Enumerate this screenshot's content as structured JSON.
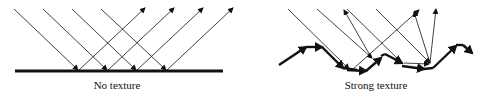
{
  "panels": [
    {
      "id": "left",
      "caption": "No texture"
    },
    {
      "id": "right",
      "caption": "Strong texture"
    }
  ],
  "colors": {
    "stroke": "#111111",
    "background": "#ffffff"
  }
}
